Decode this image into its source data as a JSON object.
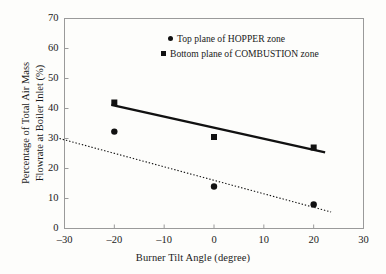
{
  "chart_data": {
    "type": "scatter",
    "title": "",
    "xlabel": "Burner Tilt Angle (degree)",
    "ylabel_line1": "Percentage of Total Air Mass",
    "ylabel_line2": "Flowrate at Boiler Inlet (%)",
    "xlim": [
      -30,
      30
    ],
    "ylim": [
      0,
      70
    ],
    "xticks": [
      "–30",
      "–20",
      "–10",
      "0",
      "10",
      "20",
      "30"
    ],
    "xtick_values": [
      -30,
      -20,
      -10,
      0,
      10,
      20,
      30
    ],
    "yticks": [
      "0",
      "10",
      "20",
      "30",
      "40",
      "50",
      "60",
      "70"
    ],
    "ytick_values": [
      0,
      10,
      20,
      30,
      40,
      50,
      60,
      70
    ],
    "grid": false,
    "legend_position": "top-center",
    "x": [
      -20,
      0,
      20
    ],
    "series": [
      {
        "name": "Top plane of HOPPER zone",
        "marker": "circle",
        "color": "#111111",
        "values": [
          32.3,
          14.0,
          8.0
        ],
        "trendline": {
          "style": "dotted",
          "x_start": -31.0,
          "y_start": 30.0,
          "x_end": 23.5,
          "y_end": 5.5
        }
      },
      {
        "name": "Bottom plane of COMBUSTION zone",
        "marker": "square",
        "color": "#111111",
        "values": [
          42.0,
          30.5,
          27.0
        ],
        "trendline": {
          "style": "solid",
          "x_start": -20.6,
          "y_start": 41.2,
          "x_end": 22.3,
          "y_end": 25.4
        }
      }
    ]
  },
  "legend": {
    "items": [
      {
        "marker": "circle",
        "label": "Top plane of HOPPER zone"
      },
      {
        "marker": "square",
        "label": "Bottom plane of COMBUSTION zone"
      }
    ]
  },
  "axes": {
    "x_title": "Burner Tilt Angle (degree)",
    "y_title_line1": "Percentage of Total Air Mass",
    "y_title_line2": "Flowrate at Boiler Inlet (%)"
  }
}
